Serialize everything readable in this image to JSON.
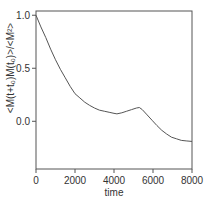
{
  "chart_data": {
    "type": "line",
    "title": "",
    "xlabel": "time",
    "ylabel": "<M(t+t₀)M(t₀)>/<M²>",
    "xlim": [
      0,
      8000
    ],
    "ylim": [
      -0.45,
      1.04
    ],
    "xticks": [
      0,
      2000,
      4000,
      6000,
      8000
    ],
    "xtick_labels": [
      "0",
      "2000",
      "4000",
      "6000",
      "8000"
    ],
    "yticks": [
      1.0,
      0.5,
      0.0
    ],
    "ytick_labels": [
      "1.0",
      "0.5",
      "0.0"
    ],
    "grid": false,
    "legend": null,
    "series": [
      {
        "name": "autocorrelation",
        "color": "#555555",
        "x": [
          0,
          250,
          500,
          750,
          1000,
          1250,
          1500,
          1750,
          2000,
          2250,
          2500,
          2750,
          3000,
          3250,
          3500,
          3750,
          4000,
          4150,
          4400,
          4650,
          4900,
          5150,
          5300,
          5450,
          5700,
          5950,
          6200,
          6450,
          6700,
          6950,
          7200,
          7450,
          7700,
          8000
        ],
        "values": [
          1.0,
          0.89,
          0.79,
          0.68,
          0.58,
          0.49,
          0.41,
          0.33,
          0.26,
          0.22,
          0.18,
          0.15,
          0.125,
          0.105,
          0.095,
          0.085,
          0.075,
          0.07,
          0.08,
          0.095,
          0.11,
          0.125,
          0.13,
          0.11,
          0.06,
          0.01,
          -0.04,
          -0.085,
          -0.12,
          -0.15,
          -0.165,
          -0.18,
          -0.185,
          -0.19
        ]
      }
    ]
  }
}
